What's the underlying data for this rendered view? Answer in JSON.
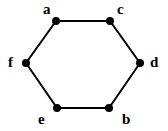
{
  "diagram": {
    "type": "graph",
    "title": "",
    "colors": {
      "edge": "#000000",
      "node": "#000000",
      "label": "#000000",
      "background": "#ffffff"
    },
    "nodes": [
      {
        "id": "a",
        "label": "a",
        "x": 56,
        "y": 21,
        "label_x": 43,
        "label_y": 14
      },
      {
        "id": "c",
        "label": "c",
        "x": 110,
        "y": 21,
        "label_x": 117,
        "label_y": 14
      },
      {
        "id": "d",
        "label": "d",
        "x": 140,
        "y": 63,
        "label_x": 150,
        "label_y": 67
      },
      {
        "id": "b",
        "label": "b",
        "x": 109,
        "y": 108,
        "label_x": 122,
        "label_y": 124
      },
      {
        "id": "e",
        "label": "e",
        "x": 57,
        "y": 108,
        "label_x": 38,
        "label_y": 124
      },
      {
        "id": "f",
        "label": "f",
        "x": 26,
        "y": 63,
        "label_x": 8,
        "label_y": 67
      }
    ],
    "edges": [
      [
        "a",
        "c"
      ],
      [
        "c",
        "d"
      ],
      [
        "d",
        "b"
      ],
      [
        "b",
        "e"
      ],
      [
        "e",
        "f"
      ],
      [
        "f",
        "a"
      ]
    ]
  }
}
